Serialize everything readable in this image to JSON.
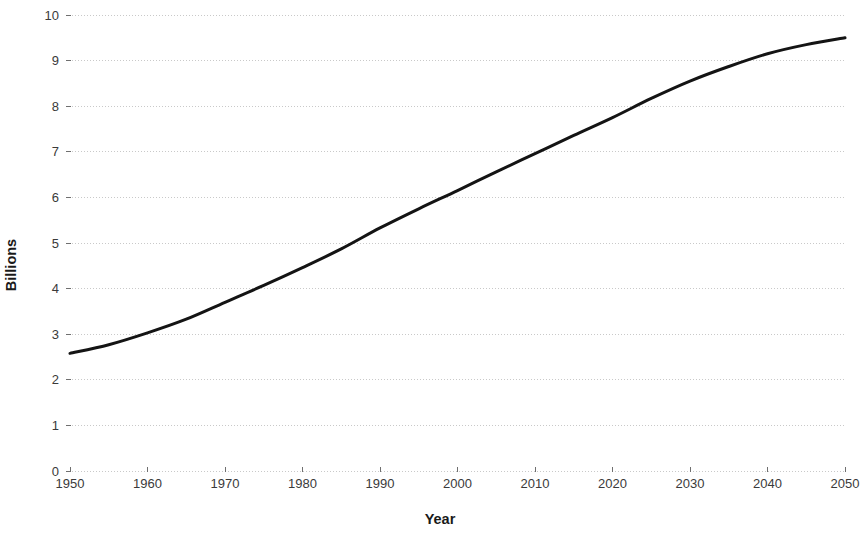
{
  "chart_data": {
    "type": "line",
    "title": "",
    "subtitle": "",
    "xlabel": "Year",
    "ylabel": "Billions",
    "xlim": [
      1950,
      2050
    ],
    "ylim": [
      0,
      10
    ],
    "grid": true,
    "grid_axis": "y",
    "legend": false,
    "legend_position": "none",
    "x_tick_labels": [
      "1950",
      "1960",
      "1970",
      "1980",
      "1990",
      "2000",
      "2010",
      "2020",
      "2030",
      "2040",
      "2050"
    ],
    "y_tick_labels": [
      "0",
      "1",
      "2",
      "3",
      "4",
      "5",
      "6",
      "7",
      "8",
      "9",
      "10"
    ],
    "x": [
      1950,
      1955,
      1960,
      1965,
      1970,
      1975,
      1980,
      1985,
      1990,
      1995,
      2000,
      2005,
      2010,
      2015,
      2020,
      2025,
      2030,
      2035,
      2040,
      2045,
      2050
    ],
    "series": [
      {
        "name": "World population",
        "color": "#141414",
        "values": [
          2.58,
          2.77,
          3.03,
          3.33,
          3.7,
          4.07,
          4.46,
          4.87,
          5.33,
          5.75,
          6.15,
          6.56,
          6.96,
          7.36,
          7.75,
          8.17,
          8.55,
          8.87,
          9.15,
          9.35,
          9.5
        ]
      }
    ]
  },
  "axes": {
    "y_title": "Billions",
    "x_title": "Year"
  }
}
